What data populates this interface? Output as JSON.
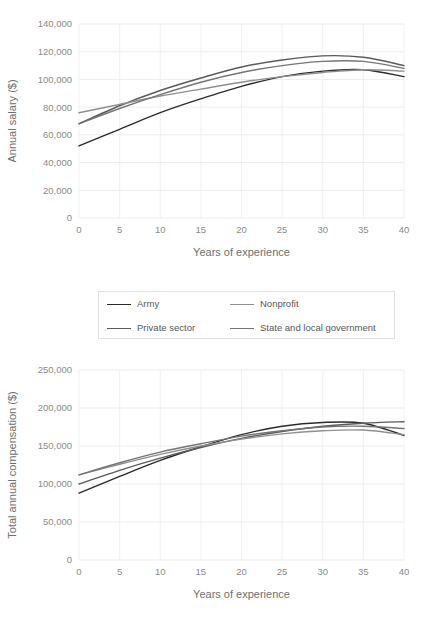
{
  "legend": {
    "entries": [
      {
        "label": "Army",
        "color": "#2b2b2b"
      },
      {
        "label": "Nonprofit",
        "color": "#8f8f8f"
      },
      {
        "label": "Private sector",
        "color": "#5a5a5a"
      },
      {
        "label": "State and local government",
        "color": "#757575"
      }
    ]
  },
  "chart_data": [
    {
      "type": "line",
      "id": "annual-salary",
      "title": "",
      "xlabel": "Years of experience",
      "ylabel": "Annual salary ($)",
      "xlim": [
        0,
        40
      ],
      "ylim": [
        0,
        140000
      ],
      "grid": true,
      "legend_position": "below",
      "xticks": [
        0,
        5,
        10,
        15,
        20,
        25,
        30,
        35,
        40
      ],
      "xticklabels": [
        "0",
        "5",
        "10",
        "15",
        "20",
        "25",
        "30",
        "35",
        "40"
      ],
      "yticks": [
        0,
        20000,
        40000,
        60000,
        80000,
        100000,
        120000,
        140000
      ],
      "yticklabels": [
        "0",
        "20,000",
        "40,000",
        "60,000",
        "80,000",
        "100,000",
        "120,000",
        "140,000"
      ],
      "x": [
        0,
        5,
        10,
        15,
        20,
        25,
        30,
        35,
        40
      ],
      "series": [
        {
          "name": "Army",
          "color": "#2b2b2b",
          "values": [
            52000,
            64000,
            76000,
            86000,
            95000,
            102000,
            106000,
            107000,
            102000
          ]
        },
        {
          "name": "Private sector",
          "color": "#5a5a5a",
          "values": [
            68000,
            81000,
            92000,
            101000,
            109000,
            114000,
            117000,
            116000,
            110000
          ]
        },
        {
          "name": "Nonprofit",
          "color": "#8f8f8f",
          "values": [
            76000,
            82000,
            88000,
            93000,
            98000,
            102000,
            105000,
            107000,
            106000
          ]
        },
        {
          "name": "State and local government",
          "color": "#757575",
          "values": [
            68000,
            79000,
            89000,
            98000,
            105000,
            110000,
            113000,
            113000,
            108000
          ]
        }
      ]
    },
    {
      "type": "line",
      "id": "total-annual-compensation",
      "title": "",
      "xlabel": "Years of experience",
      "ylabel": "Total annual compensation ($)",
      "xlim": [
        0,
        40
      ],
      "ylim": [
        0,
        250000
      ],
      "grid": true,
      "legend_position": "above",
      "xticks": [
        0,
        5,
        10,
        15,
        20,
        25,
        30,
        35,
        40
      ],
      "xticklabels": [
        "0",
        "5",
        "10",
        "15",
        "20",
        "25",
        "30",
        "35",
        "40"
      ],
      "yticks": [
        0,
        50000,
        100000,
        150000,
        200000,
        250000
      ],
      "yticklabels": [
        "0",
        "50,000",
        "100,000",
        "150,000",
        "200,000",
        "250,000"
      ],
      "x": [
        0,
        5,
        10,
        15,
        20,
        25,
        30,
        35,
        40
      ],
      "series": [
        {
          "name": "Army",
          "color": "#2b2b2b",
          "values": [
            88000,
            110000,
            131000,
            149000,
            165000,
            176000,
            181000,
            180000,
            164000
          ]
        },
        {
          "name": "Private sector",
          "color": "#5a5a5a",
          "values": [
            100000,
            118000,
            134000,
            148000,
            160000,
            169000,
            176000,
            180000,
            182000
          ]
        },
        {
          "name": "Nonprofit",
          "color": "#8f8f8f",
          "values": [
            112000,
            126000,
            139000,
            150000,
            159000,
            166000,
            170000,
            171000,
            165000
          ]
        },
        {
          "name": "State and local government",
          "color": "#757575",
          "values": [
            112000,
            128000,
            142000,
            153000,
            163000,
            170000,
            175000,
            176000,
            173000
          ]
        }
      ]
    }
  ]
}
